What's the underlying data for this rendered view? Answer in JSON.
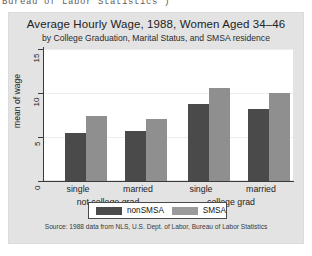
{
  "page": {
    "clipped_header_text": "Bureau of Labor Statistics )"
  },
  "chart_data": {
    "type": "bar",
    "title": "Average Hourly Wage, 1988, Women Aged 34–46",
    "subtitle": "by College Graduation, Marital Status, and SMSA residence",
    "ylabel": "mean of wage",
    "xlabel": "",
    "ylim": [
      0,
      15
    ],
    "yticks": [
      0,
      5,
      10,
      15
    ],
    "ytick_labels": [
      "0",
      "5",
      "10",
      "15"
    ],
    "grid": true,
    "legend_position": "bottom",
    "categories": [
      "single",
      "married",
      "single",
      "married"
    ],
    "groups": [
      {
        "label": "not college grad",
        "categories": [
          "single",
          "married"
        ]
      },
      {
        "label": "college grad",
        "categories": [
          "single",
          "married"
        ]
      }
    ],
    "series": [
      {
        "name": "nonSMSA",
        "color": "#4a4a4a",
        "values": [
          5.4,
          5.7,
          8.7,
          8.2
        ]
      },
      {
        "name": "SMSA",
        "color": "#8f8f8f",
        "values": [
          7.4,
          7.1,
          10.6,
          10.0
        ]
      }
    ],
    "source_note": "Source:  1988 data from NLS, U.S. Dept. of Labor, Bureau of Labor Statistics"
  }
}
